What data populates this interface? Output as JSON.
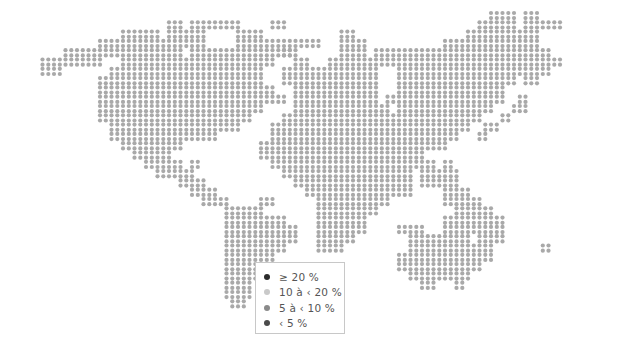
{
  "map": {
    "grid": {
      "x0": 22,
      "y0": 13,
      "pitch": 5.85,
      "dot_radius": 2.1
    },
    "colors": {
      "land": "#a9a9a9",
      "ge20": "#2b2b2b",
      "10to20": "#c9c9c9",
      "5to10": "#8a8a8a",
      "lt5": "#4a4a4a"
    },
    "land_rows": [
      [
        [
          92,
          96
        ],
        [
          98,
          100
        ]
      ],
      [
        [
          36,
          38
        ],
        [
          40,
          48
        ],
        [
          54,
          56
        ],
        [
          90,
          96
        ],
        [
          98,
          104
        ]
      ],
      [
        [
          28,
          34
        ],
        [
          36,
          42
        ],
        [
          48,
          52
        ],
        [
          66,
          68
        ],
        [
          88,
          100
        ]
      ],
      [
        [
          24,
          42
        ],
        [
          48,
          62
        ],
        [
          66,
          70
        ],
        [
          84,
          100
        ]
      ],
      [
        [
          18,
          38
        ],
        [
          40,
          58
        ],
        [
          66,
          70
        ],
        [
          56,
          57
        ],
        [
          72,
          102
        ]
      ],
      [
        [
          14,
          24
        ],
        [
          28,
          54
        ],
        [
          58,
          60
        ],
        [
          64,
          104
        ]
      ],
      [
        [
          14,
          17
        ],
        [
          26,
          52
        ],
        [
          56,
          72
        ],
        [
          76,
          102
        ]
      ],
      [
        [
          24,
          52
        ],
        [
          56,
          72
        ],
        [
          76,
          96
        ],
        [
          98,
          100
        ]
      ],
      [
        [
          24,
          54
        ],
        [
          58,
          72
        ],
        [
          76,
          94
        ]
      ],
      [
        [
          24,
          56
        ],
        [
          58,
          72
        ],
        [
          74,
          94
        ],
        [
          97,
          98
        ]
      ],
      [
        [
          24,
          52
        ],
        [
          58,
          74
        ],
        [
          76,
          92
        ],
        [
          96,
          98
        ]
      ],
      [
        [
          24,
          50
        ],
        [
          56,
          90
        ],
        [
          94,
          95
        ]
      ],
      [
        [
          26,
          48
        ],
        [
          54,
          88
        ],
        [
          91,
          93
        ]
      ],
      [
        [
          26,
          44
        ],
        [
          54,
          86
        ],
        [
          90,
          91
        ]
      ],
      [
        [
          28,
          38
        ],
        [
          52,
          84
        ]
      ],
      [
        [
          30,
          36
        ],
        [
          52,
          80
        ]
      ],
      [
        [
          32,
          38
        ],
        [
          40,
          41
        ],
        [
          54,
          82
        ],
        [
          84,
          85
        ]
      ],
      [
        [
          34,
          40
        ],
        [
          56,
          78
        ],
        [
          80,
          86
        ]
      ],
      [
        [
          38,
          42
        ],
        [
          58,
          78
        ],
        [
          80,
          86
        ]
      ],
      [
        [
          40,
          44
        ],
        [
          60,
          78
        ],
        [
          84,
          88
        ]
      ],
      [
        [
          42,
          46
        ],
        [
          52,
          54
        ],
        [
          62,
          74
        ],
        [
          84,
          90
        ]
      ],
      [
        [
          46,
          52
        ],
        [
          62,
          72
        ],
        [
          86,
          92
        ]
      ],
      [
        [
          46,
          56
        ],
        [
          62,
          70
        ],
        [
          84,
          94
        ]
      ],
      [
        [
          46,
          58
        ],
        [
          62,
          70
        ],
        [
          76,
          80
        ],
        [
          84,
          94
        ]
      ],
      [
        [
          46,
          58
        ],
        [
          62,
          68
        ],
        [
          78,
          88
        ],
        [
          90,
          94
        ]
      ],
      [
        [
          46,
          56
        ],
        [
          62,
          66
        ],
        [
          78,
          92
        ],
        [
          101,
          102
        ]
      ],
      [
        [
          46,
          54
        ],
        [
          76,
          92
        ]
      ],
      [
        [
          46,
          52
        ],
        [
          76,
          90
        ]
      ],
      [
        [
          46,
          52
        ],
        [
          78,
          88
        ]
      ],
      [
        [
          46,
          50
        ],
        [
          80,
          82
        ],
        [
          86,
          87
        ]
      ],
      [
        [
          46,
          50
        ]
      ],
      [
        [
          47,
          49
        ]
      ]
    ],
    "row_note": "land_rows indices are grid-row; spans are [startCol,endCol] in grid columns"
  },
  "legend": {
    "items": [
      {
        "label": "≥ 20 %",
        "color_key": "ge20"
      },
      {
        "label": "10 à ‹ 20 %",
        "color_key": "10to20"
      },
      {
        "label": "5 à ‹ 10 %",
        "color_key": "5to10"
      },
      {
        "label": "‹ 5 %",
        "color_key": "lt5"
      }
    ]
  }
}
